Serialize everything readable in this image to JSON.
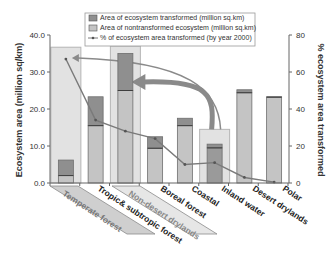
{
  "chart_data": {
    "type": "bar",
    "title": "",
    "categories": [
      "Temperate forest",
      "Tropic& subtropic forest",
      "Non-desert drylands",
      "Boreal forest",
      "Coastal",
      "Inland water",
      "Desert drylands",
      "Polar"
    ],
    "series": [
      {
        "name": "Area of ecosystem transformed (million sq.km)",
        "type": "bar",
        "axis": "left",
        "color": "#8f8f8f",
        "values": [
          4.2,
          7.8,
          10.0,
          3.1,
          2.0,
          1.0,
          0.8,
          0.1
        ]
      },
      {
        "name": "Area of nontransformed ecosystem (million sq.km)",
        "type": "bar",
        "axis": "left",
        "color": "#c4c4c4",
        "values": [
          2.0,
          15.5,
          25.0,
          9.4,
          15.5,
          9.5,
          24.4,
          23.2
        ]
      },
      {
        "name": "% of ecosystem area transformed (by year 2000)",
        "type": "line",
        "axis": "right",
        "color": "#7a7a7a",
        "values": [
          67,
          34,
          28,
          24,
          10,
          11,
          3,
          0.5
        ]
      }
    ],
    "highlight_boxes": [
      {
        "category": "Temperate forest",
        "top": 36.7
      },
      {
        "category": "Non-desert drylands",
        "top": 37.0
      },
      {
        "category": "Inland water",
        "top": 14.5
      }
    ],
    "annotations": [
      "Arrow from Inland water highlight to Non-desert drylands",
      "Arrow from Inland water to Temperate forest"
    ],
    "highlighted_labels": [
      "Temperate forest",
      "Non-desert drylands"
    ],
    "ylabel": "Ecosystem area (million sq/km)",
    "y2label": "% ecosystem area transformed",
    "xlabel": "",
    "ylim": [
      0,
      40
    ],
    "y2lim": [
      0,
      80
    ],
    "yticks": [
      "0.0",
      "10.0",
      "20.0",
      "30.0",
      "40.0"
    ],
    "y2ticks": [
      "0",
      "20",
      "40",
      "60",
      "80"
    ],
    "grid": false,
    "legend_position": "top-center"
  }
}
